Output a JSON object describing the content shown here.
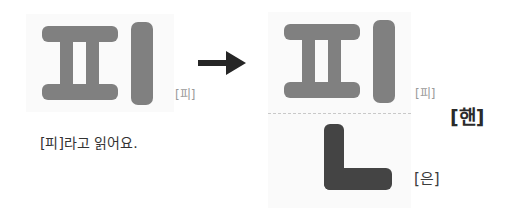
{
  "colors": {
    "page_background": "#ffffff",
    "panel_background": "#fafafa",
    "jamo_light_gray": "#808080",
    "jamo_dark_gray": "#444444",
    "arrow": "#262626",
    "small_label_text": "#9a9a9a",
    "caption_text": "#333333",
    "combined_label_text": "#2b2b2b",
    "divider": "#c9c9c9"
  },
  "left_block": {
    "name": "syllable-pi",
    "jamo": [
      {
        "icon": "jamo-pieup-icon",
        "letter": "ㅍ"
      },
      {
        "icon": "jamo-vowel-i-icon",
        "letter": "ㅣ"
      }
    ],
    "reading_label": "[피]",
    "caption": "[피]라고 읽어요."
  },
  "arrow": {
    "icon": "arrow-right-icon",
    "label": "→"
  },
  "right_block": {
    "name": "syllable-pin",
    "onset_rime": {
      "jamo": [
        {
          "icon": "jamo-pieup-icon",
          "letter": "ㅍ"
        },
        {
          "icon": "jamo-vowel-i-icon",
          "letter": "ㅣ"
        }
      ],
      "reading_label": "[피]"
    },
    "final": {
      "jamo": [
        {
          "icon": "jamo-nieun-icon",
          "letter": "ㄴ"
        }
      ],
      "reading_label": "[은]"
    },
    "combined_label": "[핸]"
  }
}
